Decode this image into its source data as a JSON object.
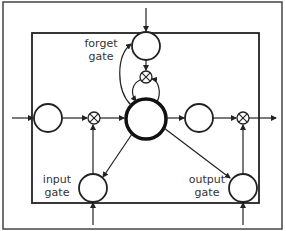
{
  "diagram": {
    "type": "lstm-cell",
    "labels": {
      "forget_gate": [
        "forget",
        "gate"
      ],
      "input_gate": [
        "input",
        "gate"
      ],
      "output_gate": [
        "output",
        "gate"
      ]
    },
    "nodes": [
      {
        "id": "cell-input",
        "kind": "unit"
      },
      {
        "id": "input-multiply",
        "kind": "multiply"
      },
      {
        "id": "memory-cell",
        "kind": "cell"
      },
      {
        "id": "forget-gate",
        "kind": "gate"
      },
      {
        "id": "forget-multiply",
        "kind": "multiply"
      },
      {
        "id": "cell-output",
        "kind": "unit"
      },
      {
        "id": "output-multiply",
        "kind": "multiply"
      },
      {
        "id": "input-gate",
        "kind": "gate"
      },
      {
        "id": "output-gate",
        "kind": "gate"
      }
    ],
    "colors": {
      "stroke": "#222222",
      "frame": "#444444",
      "background": "#ffffff"
    }
  }
}
